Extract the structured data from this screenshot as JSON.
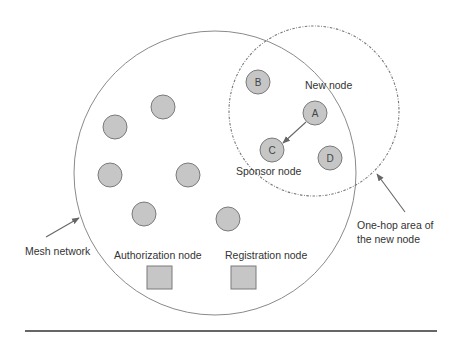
{
  "diagram": {
    "colors": {
      "node_fill": "#c6c6c6",
      "node_stroke": "#7a7a7a",
      "circle_stroke": "#8a8a8a",
      "dashed_stroke": "#777777",
      "arrow": "#666666",
      "rule": "#333333",
      "text": "#333333"
    },
    "mesh_network": {
      "label": "Mesh network",
      "cx": 215,
      "cy": 173,
      "rx": 141,
      "ry": 142
    },
    "one_hop_area": {
      "label_line1": "One-hop area of",
      "label_line2": "the new node",
      "cx": 314,
      "cy": 111,
      "r": 85
    },
    "labeled_nodes": [
      {
        "id": "B",
        "label": "B",
        "cx": 258,
        "cy": 82
      },
      {
        "id": "A",
        "label": "A",
        "cx": 315,
        "cy": 113
      },
      {
        "id": "C",
        "label": "C",
        "cx": 272,
        "cy": 150
      },
      {
        "id": "D",
        "label": "D",
        "cx": 330,
        "cy": 158
      }
    ],
    "unlabeled_nodes": [
      {
        "cx": 163,
        "cy": 107
      },
      {
        "cx": 115,
        "cy": 127
      },
      {
        "cx": 110,
        "cy": 175
      },
      {
        "cx": 188,
        "cy": 175
      },
      {
        "cx": 144,
        "cy": 214
      },
      {
        "cx": 228,
        "cy": 219
      }
    ],
    "node_radius": 12,
    "annotations": {
      "new_node": "New node",
      "sponsor_node": "Sponsor node",
      "authorization_node": "Authorization node",
      "registration_node": "Registration node"
    },
    "servers": [
      {
        "id": "authorization",
        "x": 147,
        "y": 266,
        "w": 25,
        "h": 23
      },
      {
        "id": "registration",
        "x": 231,
        "y": 266,
        "w": 25,
        "h": 23
      }
    ],
    "edges": [
      {
        "from": "A",
        "to": "C",
        "type": "arrow"
      }
    ]
  }
}
